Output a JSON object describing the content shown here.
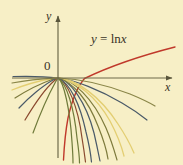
{
  "figure": {
    "name": "logarithm-family-graph",
    "width": 183,
    "height": 165,
    "background_color": "#F7EFC6"
  },
  "axes": {
    "x_label": "x",
    "y_label": "y",
    "origin_label": "0",
    "axis_color": "#6E6A4A",
    "x_axis": {
      "y_px": 78,
      "x_start_px": 12,
      "x_end_px": 172,
      "arrow": "right"
    },
    "y_axis": {
      "x_px": 58,
      "y_start_px": 158,
      "y_end_px": 16,
      "arrow": "up"
    }
  },
  "annotation": {
    "equation_lhs": "y",
    "equation_op": "=",
    "equation_fn": "ln",
    "equation_arg": "x",
    "equation_full": "y = ln x",
    "color": "#3a3326"
  },
  "chart_data": {
    "type": "line",
    "title": "",
    "subtitle": "",
    "xlabel": "x",
    "ylabel": "y",
    "grid": false,
    "legend": "annotation",
    "xlim": [
      -1.7,
      3.4
    ],
    "ylim": [
      -4.4,
      2.1
    ],
    "annotations": [
      {
        "text": "y = ln x",
        "x_px": 91,
        "y_px": 32,
        "color": "#3a3326"
      },
      {
        "text": "0",
        "x_px": 44,
        "y_px": 59,
        "color": "#3a3326"
      },
      {
        "text": "y",
        "x_px": 46,
        "y_px": 10,
        "color": "#3a3326"
      },
      {
        "text": "x",
        "x_px": 165,
        "y_px": 81,
        "color": "#3a3326"
      }
    ],
    "series": [
      {
        "name": "y = ln x",
        "color": "#C0392B",
        "width": 1.4,
        "highlight": true,
        "path": "M 84.5 78.5 C 100 71 128 59 175 47 M 84.5 78.5 C 78 86 72 100 68 118 C 65 134 64 150 63.5 160"
      },
      {
        "name": "curve-slate-right-outer",
        "color": "#4A5A68",
        "width": 1.2,
        "highlight": false,
        "path": "M 13 76.5 C 30 76 50 77 58 78 C 75 80 100 90 122 103 C 134 110 142 116 147 120"
      },
      {
        "name": "curve-yellow-left-outer",
        "color": "#E3CE72",
        "width": 1.3,
        "highlight": false,
        "path": "M 12 90 C 22 86 38 81 50 79 C 56 78 58 78 58 78 C 76 79 100 96 118 124 C 126 136 131 146 134 153"
      },
      {
        "name": "curve-olive-left-1",
        "color": "#7D7A3C",
        "width": 1.2,
        "highlight": false,
        "path": "M 15 98 C 26 91 42 83 52 79.5 C 56 78.3 58 78 58 78 C 73 79.5 93 98 106 128 C 112 142 115 153 117 160"
      },
      {
        "name": "curve-slate-left-1",
        "color": "#4A5A68",
        "width": 1.2,
        "highlight": false,
        "path": "M 19 108 C 29 97 44 85 53 80 C 56 78.5 58 78 58 78 C 70 80 86 102 94 133 C 97 146 99 156 100 161"
      },
      {
        "name": "curve-brown-left-2",
        "color": "#8B4A2F",
        "width": 1.2,
        "highlight": false,
        "path": "M 25 120 C 34 105 46 88 54 81 C 56.5 79 58 78 58 78 C 67 81 78 106 82 138 C 84 150 85 158 85.5 162"
      },
      {
        "name": "curve-olive-left-2",
        "color": "#6F7A3A",
        "width": 1.2,
        "highlight": false,
        "path": "M 33 133 C 40 114 50 92 55.5 82 C 57 79.5 58 78 58 78 C 64 82 70 110 72 142 C 72.8 153 73 160 73 163"
      },
      {
        "name": "curve-yellow-right-outer",
        "color": "#E3CE72",
        "width": 1.3,
        "highlight": false,
        "path": "M 58 78 C 76 81 96 96 110 121 C 118 136 122 148 124 156"
      },
      {
        "name": "curve-olive-right-1",
        "color": "#7D7A3C",
        "width": 1.2,
        "highlight": false,
        "path": "M 58 78 C 73 82 88 100 98 126 C 104 141 107 152 108 159"
      },
      {
        "name": "curve-slate-right-1",
        "color": "#4A5A68",
        "width": 1.2,
        "highlight": false,
        "path": "M 58 78 C 70 83 80 104 86 132 C 90 148 91 157 91.5 162"
      },
      {
        "name": "curve-olive-right-2",
        "color": "#6F7A3A",
        "width": 1.2,
        "highlight": false,
        "path": "M 58 78 C 67 84 74 108 77 138 C 79 152 79.5 159 79.5 163"
      },
      {
        "name": "curve-olive-far-left",
        "color": "#8A8648",
        "width": 1.2,
        "highlight": false,
        "path": "M 12 83 C 26 80.5 44 78.8 55 78.2 C 57 78.05 58 78 58 78 C 78 78.8 104 84 130 94 C 142 99 150 103 155 106"
      }
    ]
  }
}
